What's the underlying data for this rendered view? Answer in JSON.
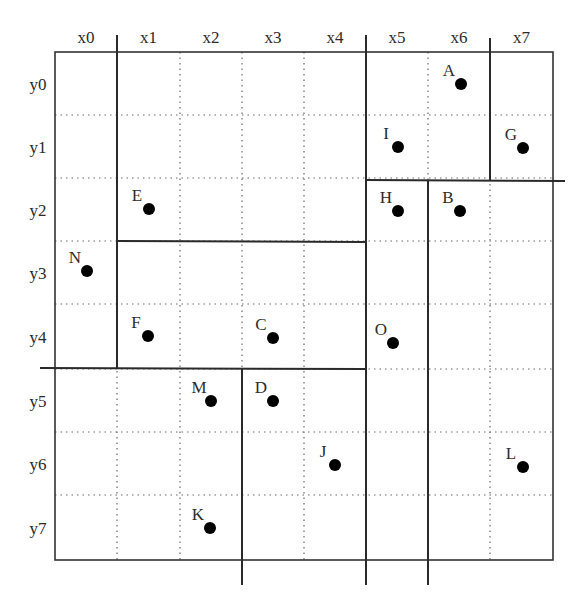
{
  "diagram": {
    "title": "",
    "grid": {
      "origin": [
        55,
        52
      ],
      "x_edges": [
        55,
        117,
        180,
        242,
        304,
        366,
        428,
        490,
        553
      ],
      "y_edges": [
        52,
        115,
        178,
        241,
        304,
        369,
        432,
        495,
        560
      ]
    },
    "column_labels": [
      "x0",
      "x1",
      "x2",
      "x3",
      "x4",
      "x5",
      "x6",
      "x7"
    ],
    "row_labels": [
      "y0",
      "y1",
      "y2",
      "y3",
      "y4",
      "y5",
      "y6",
      "y7"
    ],
    "partition_lines": [
      {
        "id": "split-x4-x5",
        "orientation": "vertical",
        "x1": 366,
        "y1": 35,
        "x2": 366,
        "y2": 585
      },
      {
        "id": "split-y4-y5-left",
        "orientation": "horizontal",
        "x1": 40,
        "y1": 368,
        "x2": 366,
        "y2": 369
      },
      {
        "id": "split-x0-x1-top",
        "orientation": "vertical",
        "x1": 117,
        "y1": 35,
        "x2": 117,
        "y2": 368
      },
      {
        "id": "split-y2-y3-mid",
        "orientation": "horizontal",
        "x1": 117,
        "y1": 241,
        "x2": 366,
        "y2": 242
      },
      {
        "id": "split-x2-x3-bottom",
        "orientation": "vertical",
        "x1": 242,
        "y1": 369,
        "x2": 242,
        "y2": 585
      },
      {
        "id": "split-y1-y2-right",
        "orientation": "horizontal",
        "x1": 366,
        "y1": 180,
        "x2": 565,
        "y2": 181
      },
      {
        "id": "split-x5-x6-bottom",
        "orientation": "vertical",
        "x1": 428,
        "y1": 180,
        "x2": 428,
        "y2": 585
      },
      {
        "id": "split-x6-x7-top",
        "orientation": "vertical",
        "x1": 490,
        "y1": 38,
        "x2": 490,
        "y2": 180
      }
    ],
    "points": [
      {
        "label": "A",
        "cell": "x6,y0",
        "x": 461,
        "y": 84
      },
      {
        "label": "I",
        "cell": "x5,y1",
        "x": 398,
        "y": 147
      },
      {
        "label": "G",
        "cell": "x7,y1",
        "x": 523,
        "y": 148
      },
      {
        "label": "E",
        "cell": "x1,y2",
        "x": 149,
        "y": 209
      },
      {
        "label": "H",
        "cell": "x5,y2",
        "x": 398,
        "y": 211
      },
      {
        "label": "B",
        "cell": "x6,y2",
        "x": 460,
        "y": 211
      },
      {
        "label": "N",
        "cell": "x0,y3",
        "x": 87,
        "y": 271
      },
      {
        "label": "F",
        "cell": "x1,y4",
        "x": 148,
        "y": 336
      },
      {
        "label": "C",
        "cell": "x3,y4",
        "x": 273,
        "y": 338
      },
      {
        "label": "O",
        "cell": "x5,y4",
        "x": 393,
        "y": 343
      },
      {
        "label": "M",
        "cell": "x2,y5",
        "x": 211,
        "y": 401
      },
      {
        "label": "D",
        "cell": "x3,y5",
        "x": 273,
        "y": 401
      },
      {
        "label": "J",
        "cell": "x4,y6",
        "x": 335,
        "y": 465
      },
      {
        "label": "L",
        "cell": "x7,y6",
        "x": 523,
        "y": 467
      },
      {
        "label": "K",
        "cell": "x2,y7",
        "x": 210,
        "y": 528
      }
    ],
    "colors": {
      "background": "#ffffff",
      "grid_dotted": "#6a6a6a",
      "partition": "#2a2a2a",
      "point": "#000000",
      "text": "#2b2b2b"
    }
  }
}
